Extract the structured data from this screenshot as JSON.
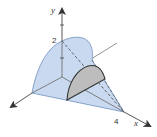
{
  "figure": {
    "axes": {
      "y_label": "y",
      "x_label": "x",
      "y_tick_label": "2",
      "x_tick_label": "4"
    },
    "colors": {
      "solid_fill": "#c9d9ef",
      "solid_edge": "#6f8fbf",
      "cross_section_fill": "#bdbdbd",
      "cross_section_edge": "#333333",
      "axis": "#555555"
    }
  }
}
